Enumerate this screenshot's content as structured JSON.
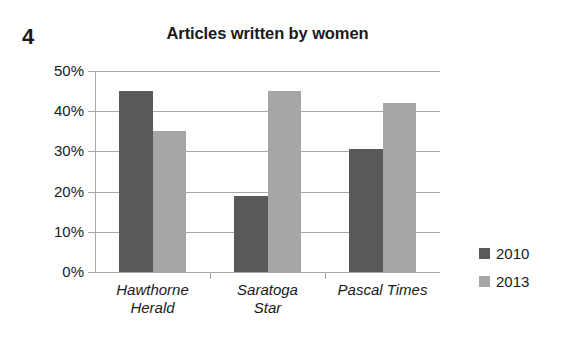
{
  "figure": {
    "number": "4"
  },
  "chart_data": {
    "type": "bar",
    "title": "Articles written by women",
    "xlabel": "",
    "ylabel": "",
    "categories": [
      "Hawthorne Herald",
      "Saratoga Star",
      "Pascal Times"
    ],
    "category_lines": [
      [
        "Hawthorne",
        "Herald"
      ],
      [
        "Saratoga",
        "Star"
      ],
      [
        "Pascal Times",
        ""
      ]
    ],
    "series": [
      {
        "name": "2010",
        "color": "#595959",
        "values": [
          45,
          19,
          30.5
        ]
      },
      {
        "name": "2013",
        "color": "#a6a6a6",
        "values": [
          35,
          45,
          42
        ]
      }
    ],
    "ylim": [
      0,
      50
    ],
    "ytick_values": [
      0,
      10,
      20,
      30,
      40,
      50
    ],
    "ytick_labels": [
      "0%",
      "10%",
      "20%",
      "30%",
      "40%",
      "50%"
    ],
    "grid": true,
    "grid_axis": "y",
    "legend_position": "right",
    "value_format": "percent"
  },
  "legend": {
    "items": [
      {
        "label": "2010",
        "swatch": "#595959"
      },
      {
        "label": "2013",
        "swatch": "#a6a6a6"
      }
    ]
  },
  "colors": {
    "series_2010": "#595959",
    "series_2013": "#a6a6a6",
    "grid": "#a8a8a8",
    "text": "#1a1a1a",
    "background": "#ffffff"
  }
}
